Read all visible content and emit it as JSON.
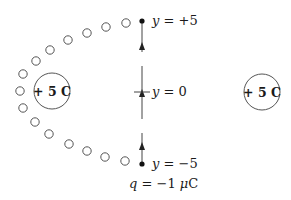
{
  "diagram": {
    "charges": [
      {
        "id": "left",
        "label": "+ 5 C",
        "cx": 52,
        "cy": 91,
        "r": 18
      },
      {
        "id": "right",
        "label": "+ 5 C",
        "cx": 262,
        "cy": 92,
        "r": 18
      }
    ],
    "test_charge": {
      "label": "q = −1 μC"
    },
    "points": {
      "top": {
        "label": "y = +5",
        "x": 142,
        "y": 21
      },
      "origin": {
        "label": "y = 0",
        "x": 142,
        "y": 92
      },
      "bottom": {
        "label": "y = −5",
        "x": 142,
        "y": 164
      }
    },
    "path_circles": [
      [
        126,
        23
      ],
      [
        106,
        27
      ],
      [
        87,
        33
      ],
      [
        68,
        40
      ],
      [
        50,
        50
      ],
      [
        36,
        61
      ],
      [
        23,
        74
      ],
      [
        20,
        91
      ],
      [
        23,
        108
      ],
      [
        35,
        122
      ],
      [
        49,
        134
      ],
      [
        69,
        144
      ],
      [
        87,
        151
      ],
      [
        105,
        157
      ],
      [
        125,
        161
      ]
    ],
    "colors": {
      "stroke": "#444444",
      "text": "#1a1a1a"
    }
  }
}
